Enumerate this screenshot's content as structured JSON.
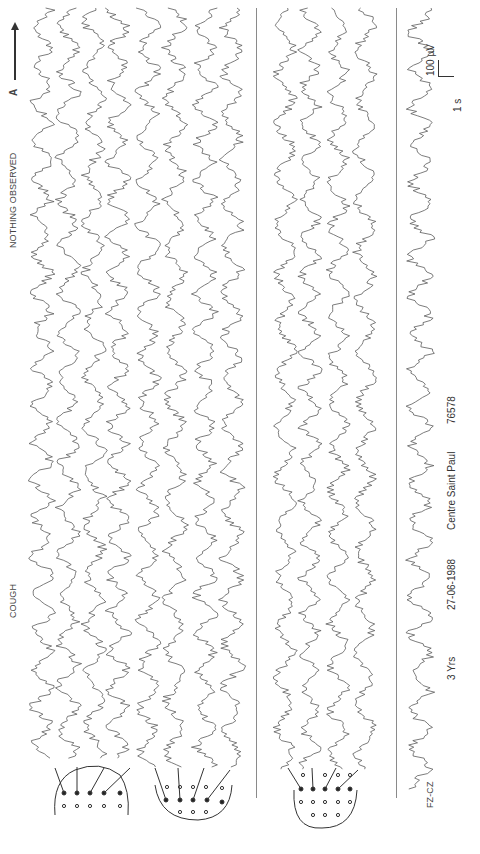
{
  "figure": {
    "orientation": "rotated-90-ccw",
    "arrow_label": "A",
    "annotations": [
      {
        "text": "COUGH",
        "x": 14,
        "y": 600
      },
      {
        "text": "NOTHING OBSERVED",
        "x": 14,
        "y": 250
      }
    ],
    "panels": [
      {
        "id": "panel-1",
        "trace_count": 4,
        "montage": "lateral-left"
      },
      {
        "id": "panel-2",
        "trace_count": 4,
        "montage": "lateral-right"
      },
      {
        "id": "panel-3",
        "trace_count": 4,
        "montage": "transverse"
      },
      {
        "id": "panel-4",
        "trace_count": 1,
        "montage": "single",
        "label": "FZ-CZ"
      }
    ],
    "scale_bar": {
      "time": "1 s",
      "amplitude": "100 µV"
    },
    "patient_info": {
      "age": "3 Yrs",
      "date": "27-06-1988",
      "center": "Centre Saint Paul",
      "record_id": "76578"
    },
    "colors": {
      "trace": "#5a5a5a",
      "separator": "#8a8a8a",
      "text": "#333333"
    }
  }
}
